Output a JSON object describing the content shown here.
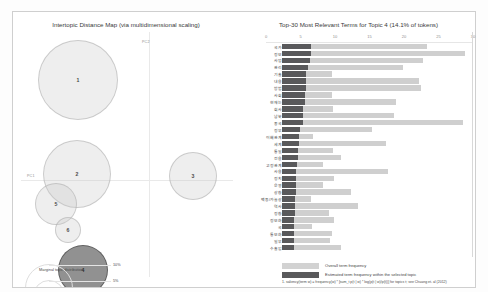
{
  "left_panel": {
    "title": "Intertopic Distance Map (via multidimensional scaling)",
    "axis_x_label": "PC1",
    "axis_y_label": "PC2",
    "legend_title": "Marginal topic distribution",
    "legend_ticks": [
      "2%",
      "5%",
      "10%"
    ],
    "topics": [
      {
        "id": "1",
        "label": "1",
        "x": 57,
        "y": 48,
        "r": 40,
        "selected": false
      },
      {
        "id": "2",
        "label": "2",
        "x": 56,
        "y": 142,
        "r": 34,
        "selected": false
      },
      {
        "id": "3",
        "label": "3",
        "x": 172,
        "y": 144,
        "r": 24,
        "selected": false
      },
      {
        "id": "5",
        "label": "5",
        "x": 35,
        "y": 172,
        "r": 21,
        "selected": false
      },
      {
        "id": "6",
        "label": "6",
        "x": 47,
        "y": 198,
        "r": 13,
        "selected": false
      },
      {
        "id": "4",
        "label": "4",
        "x": 62,
        "y": 238,
        "r": 25,
        "selected": true
      }
    ]
  },
  "right_panel": {
    "title": "Top-30 Most Relevant Terms for Topic 4 (14.1% of tokens)",
    "x_ticks": [
      "0",
      "5",
      "10",
      "15",
      "20",
      "25",
      "30"
    ],
    "x_max": 30,
    "legend": {
      "overall_label": "Overall term frequency",
      "topic_label": "Estimated term frequency within the selected topic",
      "overall_color": "#d2d2d2",
      "topic_color": "#59595b"
    },
    "footnotes": [
      "1. saliency(term w) = frequency(w) * [sum_t p(t | w) * log(p(t | w)/p(t))] for topics t; see Chuang et. al (2012)",
      "2. relevance(term w | topic t) = λ * p(w | t) + (1 - λ) * p(w | t)/p(w); see Sievert & Shirley (2014)"
    ]
  },
  "chart_data": {
    "type": "bar",
    "title": "Top-30 Most Relevant Terms for Topic 4 (14.1% of tokens)",
    "xlabel": "",
    "ylabel": "",
    "xlim": [
      0,
      30
    ],
    "grid": false,
    "orientation": "horizontal",
    "legend_position": "bottom",
    "categories": [
      "국가",
      "정보",
      "사업",
      "관리",
      "기술",
      "내용",
      "방법",
      "사회",
      "현재는",
      "회사",
      "남북",
      "중국",
      "정부",
      "이해관계",
      "세계",
      "통일",
      "전용",
      "고정관계",
      "사용",
      "정치",
      "운영",
      "상황",
      "백동/가늘상",
      "역사",
      "정황",
      "정보화",
      "국",
      "통보화",
      "일부",
      "수출입"
    ],
    "series": [
      {
        "name": "Overall term frequency",
        "values": [
          21.0,
          26.5,
          20.5,
          17.5,
          7.2,
          19.8,
          20.2,
          7.3,
          16.5,
          7.4,
          16.2,
          26.2,
          13.0,
          4.5,
          15.0,
          7.4,
          8.5,
          6.0,
          15.4,
          7.5,
          6.0,
          10.0,
          4.2,
          11.0,
          6.8,
          7.5,
          4.4,
          7.2,
          6.9,
          8.6
        ]
      },
      {
        "name": "Estimated term frequency within the selected topic",
        "values": [
          4.2,
          4.2,
          4.0,
          3.7,
          3.5,
          3.5,
          3.5,
          3.3,
          3.3,
          3.1,
          3.1,
          3.0,
          2.6,
          2.4,
          2.4,
          2.3,
          2.3,
          2.2,
          2.1,
          2.1,
          2.0,
          2.0,
          1.9,
          1.9,
          1.9,
          1.8,
          1.8,
          1.8,
          1.8,
          1.7
        ]
      }
    ]
  }
}
